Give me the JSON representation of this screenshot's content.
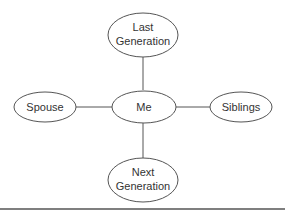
{
  "diagram": {
    "type": "family-relationship-diagram",
    "nodes": {
      "last_generation": {
        "line1": "Last",
        "line2": "Generation"
      },
      "me": {
        "label": "Me"
      },
      "spouse": {
        "label": "Spouse"
      },
      "siblings": {
        "label": "Siblings"
      },
      "next_generation": {
        "line1": "Next",
        "line2": "Generation"
      }
    },
    "edges": [
      {
        "from": "me",
        "to": "last_generation"
      },
      {
        "from": "me",
        "to": "spouse"
      },
      {
        "from": "me",
        "to": "siblings"
      },
      {
        "from": "me",
        "to": "next_generation"
      }
    ],
    "colors": {
      "stroke": "#555555",
      "text": "#333333",
      "background": "#ffffff"
    }
  }
}
